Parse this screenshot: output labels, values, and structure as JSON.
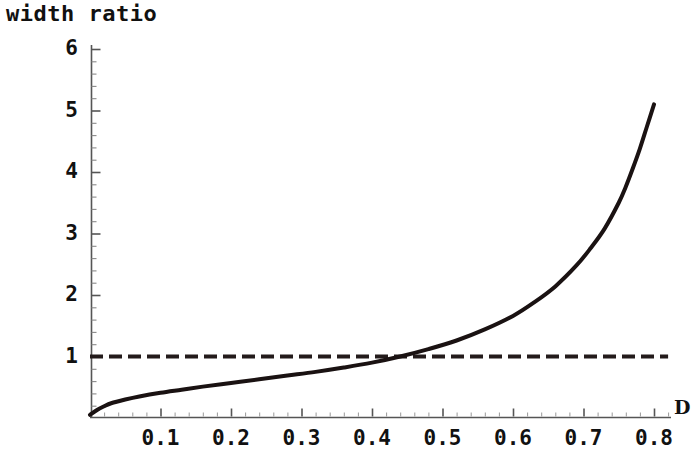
{
  "chart_data": {
    "type": "line",
    "title": "width ratio",
    "xlabel": "D",
    "ylabel": "width ratio",
    "xlim": [
      0,
      0.82
    ],
    "ylim": [
      0,
      6
    ],
    "grid": false,
    "legend": "none",
    "x_tick_labels": [
      "0.1",
      "0.2",
      "0.3",
      "0.4",
      "0.5",
      "0.6",
      "0.7",
      "0.8"
    ],
    "x_tick_values": [
      0.1,
      0.2,
      0.3,
      0.4,
      0.5,
      0.6,
      0.7,
      0.8
    ],
    "y_tick_labels": [
      "1",
      "2",
      "3",
      "4",
      "5",
      "6"
    ],
    "y_tick_values": [
      1,
      2,
      3,
      4,
      5,
      6
    ],
    "x_minor_tick_step": 0.02,
    "y_minor_tick_step": 0.2,
    "series": [
      {
        "name": "width ratio curve",
        "style": "solid",
        "color": "#1a1212",
        "width": 4,
        "x": [
          0.0,
          0.01,
          0.02,
          0.03,
          0.05,
          0.07,
          0.1,
          0.13,
          0.16,
          0.2,
          0.24,
          0.28,
          0.32,
          0.36,
          0.4,
          0.44,
          0.48,
          0.52,
          0.56,
          0.6,
          0.63,
          0.66,
          0.69,
          0.71,
          0.73,
          0.75,
          0.76,
          0.77,
          0.78,
          0.79,
          0.8
        ],
        "y": [
          0.05,
          0.13,
          0.19,
          0.24,
          0.3,
          0.35,
          0.41,
          0.46,
          0.51,
          0.57,
          0.63,
          0.69,
          0.75,
          0.82,
          0.9,
          1.0,
          1.12,
          1.26,
          1.44,
          1.66,
          1.88,
          2.14,
          2.48,
          2.76,
          3.08,
          3.5,
          3.76,
          4.06,
          4.38,
          4.74,
          5.1
        ]
      },
      {
        "name": "unity reference line",
        "style": "dashed",
        "color": "#231b1b",
        "width": 4,
        "constant_y": 1,
        "x": [
          0.0,
          0.82
        ],
        "y": [
          1,
          1
        ]
      }
    ],
    "annotations": [
      {
        "text": "crossing of unity at D ≈ 0.44",
        "x": 0.44,
        "y": 1.0
      }
    ]
  },
  "axes_geometry": {
    "origin_px": {
      "x": 90,
      "y": 418
    },
    "x_scale_px_per_unit": 705,
    "y_scale_px_per_unit": 61.5
  }
}
